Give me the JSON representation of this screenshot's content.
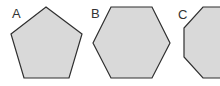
{
  "figure": {
    "shapes": [
      {
        "label": "A",
        "name": "pentagon",
        "sides": 5,
        "points": "46,7 82,34 69,78 24,78 11,34",
        "label_x": 12,
        "label_y": 18
      },
      {
        "label": "B",
        "name": "hexagon",
        "sides": 6,
        "points": "111,7 152,7 170,43 152,78 111,78 93,43",
        "label_x": 91,
        "label_y": 18
      },
      {
        "label": "C",
        "name": "octagon",
        "sides": 8,
        "points": "203,7 230,7 250,28 250,57 230,78 203,78 184,57 184,28",
        "label_x": 178,
        "label_y": 19
      }
    ],
    "colors": {
      "fill": "#d9d9d9",
      "stroke": "#2f2f2f",
      "text": "#333333"
    }
  }
}
